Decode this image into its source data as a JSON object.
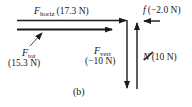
{
  "diagram": {
    "caption": "(b)",
    "colors": {
      "ink": "#1a1a1a",
      "background": "#ffffff"
    },
    "forces": {
      "horiz": {
        "symbol": "F",
        "subscript": "horiz",
        "value": "(17.3 N)",
        "direction": "right"
      },
      "tot": {
        "symbol": "F",
        "subscript": "tot",
        "value": "(15.3 N)",
        "direction": "right"
      },
      "vert": {
        "symbol": "F",
        "subscript": "vert",
        "value": "(−10 N)",
        "direction": "down"
      },
      "friction": {
        "symbol": "f",
        "value": "(−2.0 N)",
        "direction": "left"
      },
      "normal": {
        "symbol": "N",
        "value": "(10 N)",
        "direction": "up"
      }
    }
  }
}
